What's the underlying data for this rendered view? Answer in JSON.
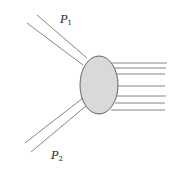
{
  "diagram": {
    "labels": {
      "p1": {
        "base": "P",
        "sub": "1"
      },
      "p2": {
        "base": "P",
        "sub": "2"
      }
    },
    "colors": {
      "blob_fill": "#d9d9d9",
      "blob_stroke": "#555555",
      "line": "#777777"
    },
    "outgoing_line_count": 7
  }
}
